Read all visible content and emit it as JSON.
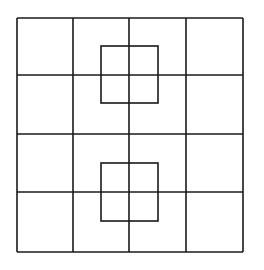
{
  "diagram": {
    "type": "grid-with-overlay-squares",
    "stroke_color": "#1a1a1a",
    "background": "#ffffff",
    "grid": {
      "rows": 4,
      "cols": 4,
      "x_lines": [
        17,
        73,
        129,
        186,
        243
      ],
      "y_lines": [
        18,
        75,
        134,
        192,
        252
      ]
    },
    "overlay_squares": [
      {
        "x": 101,
        "y": 46,
        "width": 57,
        "height": 57
      },
      {
        "x": 101,
        "y": 163,
        "width": 57,
        "height": 58
      }
    ]
  }
}
